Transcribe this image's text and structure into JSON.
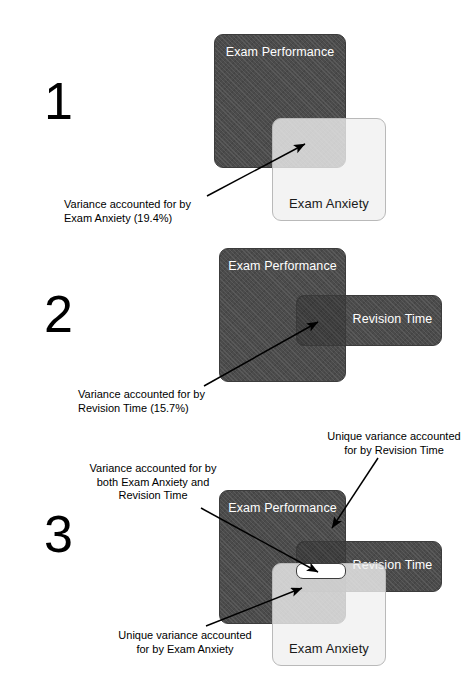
{
  "figure": {
    "panels": [
      {
        "number": "1",
        "boxes": {
          "performance": "Exam\nPerformance",
          "anxiety": "Exam Anxiety"
        },
        "callouts": [
          {
            "name": "variance-anxiety",
            "text": "Variance accounted for by\nExam Anxiety (19.4%)"
          }
        ],
        "values": {
          "anxiety_variance_pct": "19.4%"
        }
      },
      {
        "number": "2",
        "boxes": {
          "performance": "Exam\nPerformance",
          "revision": "Revision Time"
        },
        "callouts": [
          {
            "name": "variance-revision",
            "text": "Variance accounted for by\nRevision Time (15.7%)"
          }
        ],
        "values": {
          "revision_variance_pct": "15.7%"
        }
      },
      {
        "number": "3",
        "boxes": {
          "performance": "Exam\nPerformance",
          "revision": "Revision Time",
          "anxiety": "Exam Anxiety"
        },
        "callouts": [
          {
            "name": "variance-both",
            "text": "Variance accounted for by\nboth Exam Anxiety and\nRevision Time"
          },
          {
            "name": "unique-revision",
            "text": "Unique variance accounted\nfor by Revision Time"
          },
          {
            "name": "unique-anxiety",
            "text": "Unique variance accounted\nfor by Exam Anxiety"
          }
        ]
      }
    ]
  },
  "colors": {
    "performance_fill": "#4b4b4b",
    "revision_fill": "#4b4b4b",
    "anxiety_fill": "#f0f0f0",
    "overlap_fill": "#8e8e8e",
    "unique_both_fill": "#ffffff",
    "background": "#ffffff",
    "text_dark": "#000000",
    "text_light": "#ffffff"
  }
}
